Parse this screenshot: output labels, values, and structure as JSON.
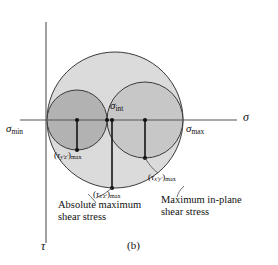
{
  "figure": {
    "caption": "(b)",
    "type": "mohrs-circle-3d",
    "axes": {
      "horizontal_label": "σ",
      "vertical_label": "τ",
      "origin_px": {
        "x": 46,
        "y": 120
      }
    },
    "axis_points": [
      {
        "name": "sigma-min",
        "label_base": "σ",
        "label_sub": "min",
        "x_px": 47
      },
      {
        "name": "sigma-int",
        "label_base": "σ",
        "label_sub": "int",
        "x_px": 107
      },
      {
        "name": "sigma-max",
        "label_base": "σ",
        "label_sub": "max",
        "x_px": 183
      }
    ],
    "circles": [
      {
        "name": "circle-absolute-max",
        "description": "outer circle sigma-min to sigma-max",
        "cx_px": 115,
        "cy_px": 120,
        "r_px": 68,
        "fill": "#d8d8d8",
        "stroke": "#3a3a3a"
      },
      {
        "name": "circle-in-plane-max",
        "description": "right circle sigma-int to sigma-max",
        "cx_px": 145,
        "cy_px": 120,
        "r_px": 38,
        "fill": "#c9c9c9",
        "stroke": "#3a3a3a"
      },
      {
        "name": "circle-yz",
        "description": "left circle sigma-min to sigma-int",
        "cx_px": 77,
        "cy_px": 120,
        "r_px": 30,
        "fill": "#b4b4b4",
        "stroke": "#3a3a3a"
      }
    ],
    "radius_markers": [
      {
        "name": "marker-tau-yz",
        "x_px": 77,
        "y_px": 150
      },
      {
        "name": "marker-tau-xz",
        "x_px": 112,
        "y_px": 188
      },
      {
        "name": "marker-tau-xy",
        "x_px": 145,
        "y_px": 158
      }
    ],
    "shear_labels": [
      {
        "name": "tau-yz-max",
        "base": "τ",
        "sub_italic": "y′z′",
        "sub_plain": "max",
        "x_px": 58,
        "y_px": 153
      },
      {
        "name": "tau-xz-max",
        "base": "τ",
        "sub_italic": "x′z′",
        "sub_plain": "max",
        "x_px": 96,
        "y_px": 192
      },
      {
        "name": "tau-xy-max",
        "base": "τ",
        "sub_italic": "x′y′",
        "sub_plain": "max",
        "x_px": 148,
        "y_px": 176
      }
    ],
    "annotations": [
      {
        "name": "absolute-maximum-shear-stress-caption",
        "line1": "Absolute maximum",
        "line2": "shear stress",
        "x_px": 80,
        "y_px": 205
      },
      {
        "name": "maximum-in-plane-shear-stress-caption",
        "line1": "Maximum in-plane",
        "line2": "shear stress",
        "x_px": 181,
        "y_px": 198
      }
    ],
    "colors": {
      "background": "#ffffff",
      "axis": "#555555",
      "outline": "#3a3a3a",
      "fill_outer": "#d8d8d8",
      "fill_mid": "#c9c9c9",
      "fill_inner": "#b4b4b4",
      "text": "#111111"
    }
  }
}
